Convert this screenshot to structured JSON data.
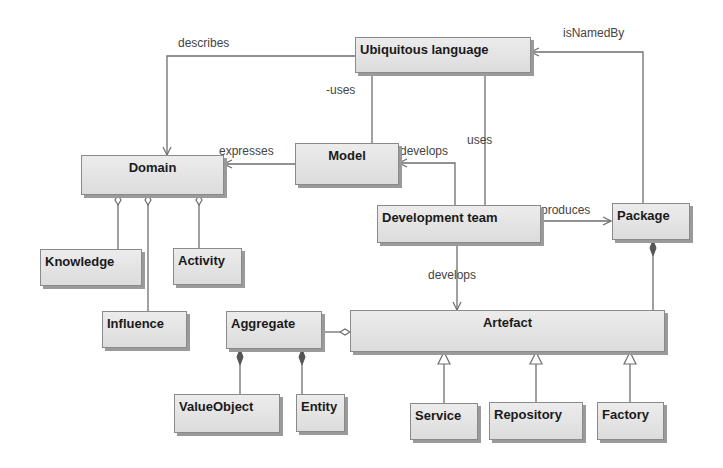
{
  "diagram": {
    "type": "UML class diagram",
    "classes": {
      "ubiquitous_language": "Ubiquitous language",
      "domain": "Domain",
      "model": "Model",
      "development_team": "Development team",
      "package": "Package",
      "knowledge": "Knowledge",
      "activity": "Activity",
      "influence": "Influence",
      "aggregate": "Aggregate",
      "artefact": "Artefact",
      "value_object": "ValueObject",
      "entity": "Entity",
      "service": "Service",
      "repository": "Repository",
      "factory": "Factory"
    },
    "relations": {
      "describes": "describes",
      "uses_minus": "-uses",
      "is_named_by": "isNamedBy",
      "expresses": "expresses",
      "develops_model": "develops",
      "uses": "uses",
      "produces": "produces",
      "develops_artefact": "develops"
    },
    "edges": [
      {
        "from": "Ubiquitous language",
        "to": "Domain",
        "label": "describes",
        "kind": "directed"
      },
      {
        "from": "Ubiquitous language",
        "to": "Model",
        "label": "-uses",
        "kind": "association"
      },
      {
        "from": "Package",
        "to": "Ubiquitous language",
        "label": "isNamedBy",
        "kind": "directed"
      },
      {
        "from": "Model",
        "to": "Domain",
        "label": "expresses",
        "kind": "directed"
      },
      {
        "from": "Development team",
        "to": "Model",
        "label": "develops",
        "kind": "directed"
      },
      {
        "from": "Development team",
        "to": "Ubiquitous language",
        "label": "uses",
        "kind": "association"
      },
      {
        "from": "Development team",
        "to": "Package",
        "label": "produces",
        "kind": "directed"
      },
      {
        "from": "Development team",
        "to": "Artefact",
        "label": "develops",
        "kind": "directed"
      },
      {
        "from": "Domain",
        "to": "Knowledge",
        "kind": "aggregation"
      },
      {
        "from": "Domain",
        "to": "Influence",
        "kind": "aggregation"
      },
      {
        "from": "Domain",
        "to": "Activity",
        "kind": "aggregation"
      },
      {
        "from": "Artefact",
        "to": "Aggregate",
        "kind": "aggregation"
      },
      {
        "from": "Aggregate",
        "to": "ValueObject",
        "kind": "composition"
      },
      {
        "from": "Aggregate",
        "to": "Entity",
        "kind": "composition"
      },
      {
        "from": "Package",
        "to": "Artefact",
        "kind": "composition"
      },
      {
        "from": "Service",
        "to": "Artefact",
        "kind": "generalization"
      },
      {
        "from": "Repository",
        "to": "Artefact",
        "kind": "generalization"
      },
      {
        "from": "Factory",
        "to": "Artefact",
        "kind": "generalization"
      }
    ]
  },
  "colors": {
    "box_fill": "#e4e4e4",
    "box_border": "#8a8a8a",
    "line": "#6e6e6e",
    "text": "#1a1a1a",
    "label": "#444444"
  }
}
